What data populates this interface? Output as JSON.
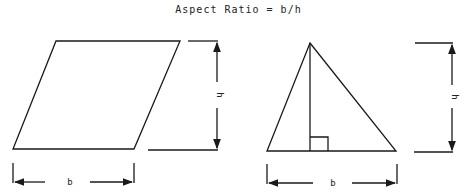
{
  "title": "Aspect Ratio = b/h",
  "figures": [
    {
      "shape": "parallelogram",
      "base_label": "b",
      "height_label": "h"
    },
    {
      "shape": "triangle",
      "base_label": "b",
      "height_label": "h"
    }
  ],
  "colors": {
    "line": "#1a1a1a",
    "background": "#ffffff"
  }
}
